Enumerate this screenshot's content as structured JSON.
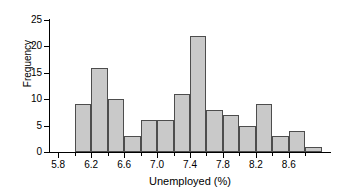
{
  "chart_data": {
    "type": "bar",
    "title": "",
    "xlabel": "Unemployed (%)",
    "ylabel": "Frequency",
    "grid": false,
    "legend": null,
    "bin_width": 0.2,
    "xlim": [
      5.7,
      9.1
    ],
    "ylim": [
      0,
      25
    ],
    "categories": [
      "6.0-6.2",
      "6.2-6.4",
      "6.4-6.6",
      "6.6-6.8",
      "6.8-7.0",
      "7.0-7.2",
      "7.2-7.4",
      "7.4-7.6",
      "7.6-7.8",
      "7.8-8.0",
      "8.0-8.2",
      "8.2-8.4",
      "8.4-8.6",
      "8.6-8.8",
      "8.8-9.0"
    ],
    "bin_starts": [
      6.0,
      6.2,
      6.4,
      6.6,
      6.8,
      7.0,
      7.2,
      7.4,
      7.6,
      7.8,
      8.0,
      8.2,
      8.4,
      8.6,
      8.8
    ],
    "bin_ends": [
      6.2,
      6.4,
      6.6,
      6.8,
      7.0,
      7.2,
      7.4,
      7.6,
      7.8,
      8.0,
      8.2,
      8.4,
      8.6,
      8.8,
      9.0
    ],
    "values": [
      9,
      16,
      10,
      3,
      6,
      6,
      11,
      22,
      8,
      7,
      5,
      9,
      3,
      4,
      1
    ],
    "x_ticks": [
      5.8,
      6.2,
      6.6,
      7.0,
      7.4,
      7.8,
      8.2,
      8.6
    ],
    "x_tick_labels": [
      "5.8",
      "6.2",
      "6.6",
      "7.0",
      "7.4",
      "7.8",
      "8.2",
      "8.6"
    ],
    "x_minor_ticks": [
      6.0,
      6.4,
      6.8,
      7.2,
      7.6,
      8.0,
      8.4,
      8.8
    ],
    "y_ticks": [
      0,
      5,
      10,
      15,
      20,
      25
    ],
    "y_tick_labels": [
      "0",
      "5",
      "10",
      "15",
      "20",
      "25"
    ],
    "bar_fill_color": "#c9c9c9",
    "bar_border_color": "#4d4d4d",
    "axis_color": "#000000",
    "background_color": "#ffffff"
  }
}
